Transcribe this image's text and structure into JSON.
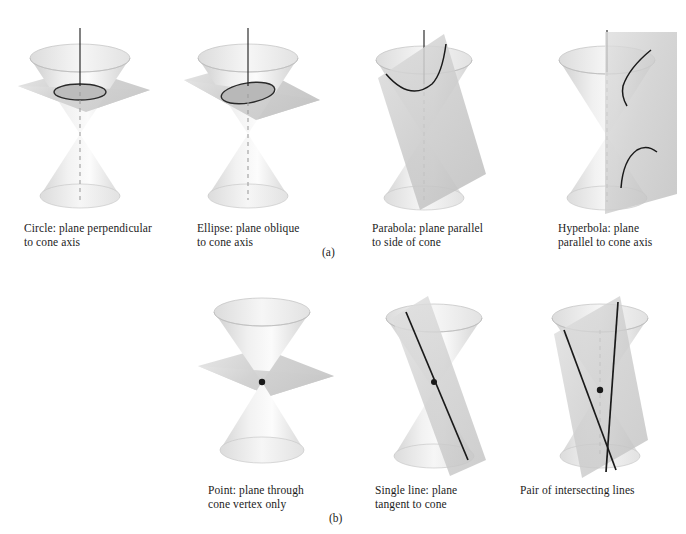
{
  "figure": {
    "kind": "conic-sections-illustration",
    "background_color": "#ffffff",
    "ink_color": "#1c1c1c",
    "cone_fill_light": "#f2f2f2",
    "cone_fill_mid": "#dcdcdc",
    "cone_fill_dark": "#c8c8c8",
    "plane_fill": "#cfcfcf",
    "curve_color": "#1a1a1a",
    "axis_color": "#1a1a1a",
    "hidden_axis_color": "#9a9a9a"
  },
  "part_labels": [
    {
      "id": "part-a",
      "text": "(a)",
      "x": 322,
      "y": 246
    },
    {
      "id": "part-b",
      "text": "(b)",
      "x": 329,
      "y": 512
    }
  ],
  "rows": [
    {
      "id": "row-a",
      "part": "(a)",
      "panels": [
        {
          "id": "panel-circle",
          "name": "circle",
          "caption_lines": [
            "Circle: plane perpendicular",
            "to cone axis"
          ],
          "caption_x": 24,
          "caption_y": 222,
          "diagram_x": 10,
          "diagram_y": 24,
          "section_curve": "circle",
          "plane_orientation": "horizontal"
        },
        {
          "id": "panel-ellipse",
          "name": "ellipse",
          "caption_lines": [
            "Ellipse: plane oblique",
            "to cone axis"
          ],
          "caption_x": 197,
          "caption_y": 222,
          "diagram_x": 178,
          "diagram_y": 24,
          "section_curve": "ellipse",
          "plane_orientation": "oblique"
        },
        {
          "id": "panel-parabola",
          "name": "parabola",
          "caption_lines": [
            "Parabola: plane parallel",
            "to side of cone"
          ],
          "caption_x": 372,
          "caption_y": 222,
          "diagram_x": 358,
          "diagram_y": 24,
          "section_curve": "parabola",
          "plane_orientation": "parallel-to-side"
        },
        {
          "id": "panel-hyperbola",
          "name": "hyperbola",
          "caption_lines": [
            "Hyperbola: plane",
            "parallel to cone axis"
          ],
          "caption_x": 558,
          "caption_y": 222,
          "diagram_x": 543,
          "diagram_y": 24,
          "section_curve": "hyperbola",
          "plane_orientation": "parallel-to-axis"
        }
      ]
    },
    {
      "id": "row-b",
      "part": "(b)",
      "panels": [
        {
          "id": "panel-point",
          "name": "point",
          "caption_lines": [
            "Point: plane through",
            "cone vertex only"
          ],
          "caption_x": 208,
          "caption_y": 484,
          "diagram_x": 192,
          "diagram_y": 290,
          "section_curve": "point",
          "plane_orientation": "horizontal-through-vertex"
        },
        {
          "id": "panel-single-line",
          "name": "single-line",
          "caption_lines": [
            "Single line: plane",
            "tangent to cone"
          ],
          "caption_x": 375,
          "caption_y": 484,
          "diagram_x": 358,
          "diagram_y": 290,
          "section_curve": "single-line",
          "plane_orientation": "tangent"
        },
        {
          "id": "panel-intersecting-lines",
          "name": "intersecting-lines",
          "caption_lines": [
            "Pair of intersecting lines"
          ],
          "caption_x": 520,
          "caption_y": 484,
          "diagram_x": 524,
          "diagram_y": 290,
          "section_curve": "pair-of-lines",
          "plane_orientation": "through-axis"
        }
      ]
    }
  ]
}
